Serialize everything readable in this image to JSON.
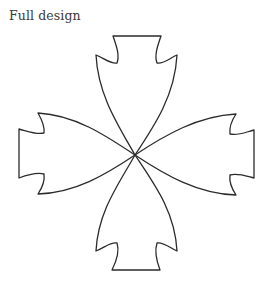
{
  "caption": {
    "text": "Full design"
  },
  "figure": {
    "arm_count": 4,
    "arms": [
      "top",
      "right",
      "bottom",
      "left"
    ],
    "stroke_color": "#2b2b2b",
    "fill_color": "#ffffff"
  }
}
